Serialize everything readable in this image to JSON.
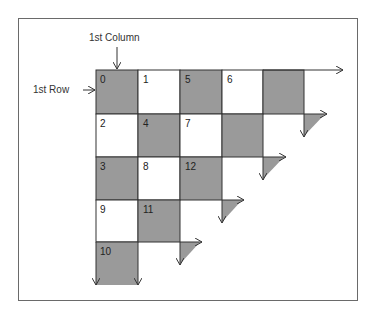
{
  "labels": {
    "first_column": "1st Column",
    "first_row": "1st Row"
  },
  "colors": {
    "gray_cell": "#9a9a9a",
    "white_cell": "#ffffff",
    "line": "#333333",
    "frame": "#6a6a6a"
  },
  "grid": {
    "cells": [
      {
        "row": 0,
        "col": 0,
        "label": "0",
        "filled": true
      },
      {
        "row": 0,
        "col": 1,
        "label": "1",
        "filled": false
      },
      {
        "row": 0,
        "col": 2,
        "label": "5",
        "filled": true
      },
      {
        "row": 0,
        "col": 3,
        "label": "6",
        "filled": false
      },
      {
        "row": 0,
        "col": 4,
        "label": "",
        "filled": true
      },
      {
        "row": 1,
        "col": 0,
        "label": "2",
        "filled": false
      },
      {
        "row": 1,
        "col": 1,
        "label": "4",
        "filled": true
      },
      {
        "row": 1,
        "col": 2,
        "label": "7",
        "filled": false
      },
      {
        "row": 1,
        "col": 3,
        "label": "",
        "filled": true
      },
      {
        "row": 2,
        "col": 0,
        "label": "3",
        "filled": true
      },
      {
        "row": 2,
        "col": 1,
        "label": "8",
        "filled": false
      },
      {
        "row": 2,
        "col": 2,
        "label": "12",
        "filled": true
      },
      {
        "row": 3,
        "col": 0,
        "label": "9",
        "filled": false
      },
      {
        "row": 3,
        "col": 1,
        "label": "11",
        "filled": true
      },
      {
        "row": 4,
        "col": 0,
        "label": "10",
        "filled": true
      }
    ]
  }
}
